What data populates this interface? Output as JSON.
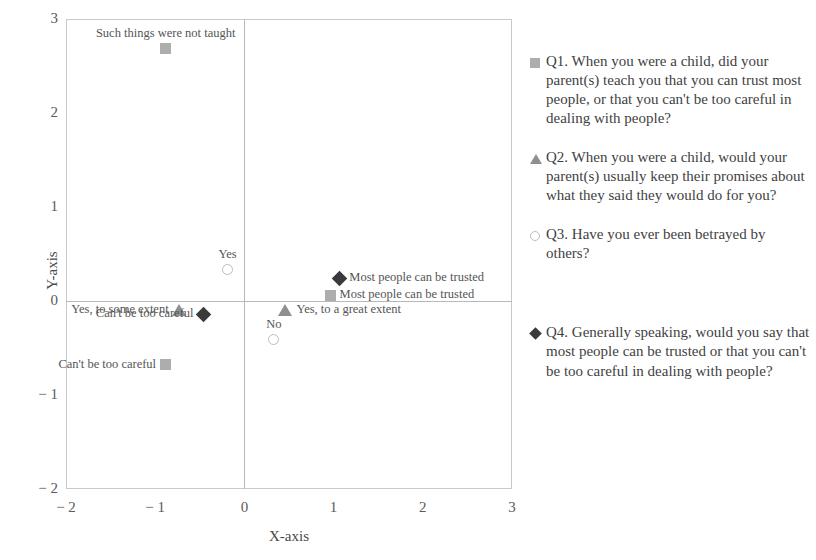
{
  "chart_data": {
    "type": "scatter",
    "title": "",
    "xlabel": "X-axis",
    "ylabel": "Y-axis",
    "xlim": [
      -2,
      3
    ],
    "ylim": [
      -2,
      3
    ],
    "xticks": [
      "− 2",
      "− 1",
      "0",
      "1",
      "2",
      "3"
    ],
    "xtick_values": [
      -2,
      -1,
      0,
      1,
      2,
      3
    ],
    "yticks": [
      "3",
      "2",
      "1",
      "0",
      "− 1",
      "− 2"
    ],
    "ytick_values": [
      3,
      2,
      1,
      0,
      -1,
      -2
    ],
    "grid": false,
    "origin_axes": true,
    "legend_position": "right",
    "series": [
      {
        "name": "Q1",
        "marker": "square",
        "color": "#adadad",
        "points": [
          {
            "label": "Such things were not taught",
            "x": -0.88,
            "y": 2.69,
            "label_pos": "above"
          },
          {
            "label": "Most people can be trusted",
            "x": 0.96,
            "y": 0.06,
            "label_pos": "right"
          },
          {
            "label": "Can't be too careful",
            "x": -0.88,
            "y": -0.68,
            "label_pos": "left"
          }
        ]
      },
      {
        "name": "Q2",
        "marker": "triangle",
        "color": "#8f8f8f",
        "points": [
          {
            "label": "Yes, to some extent",
            "x": -0.73,
            "y": -0.1,
            "label_pos": "left"
          },
          {
            "label": "Yes, to a great extent",
            "x": 0.46,
            "y": -0.1,
            "label_pos": "right"
          }
        ]
      },
      {
        "name": "Q3",
        "marker": "circle",
        "color": "#bdbdbd",
        "points": [
          {
            "label": "Yes",
            "x": -0.19,
            "y": 0.33,
            "label_pos": "above"
          },
          {
            "label": "No",
            "x": 0.33,
            "y": -0.41,
            "label_pos": "above"
          }
        ]
      },
      {
        "name": "Q4",
        "marker": "diamond",
        "color": "#3a3a3a",
        "points": [
          {
            "label": "Can't be too careful",
            "x": -0.46,
            "y": -0.14,
            "label_pos": "left"
          },
          {
            "label": "Most people can be trusted",
            "x": 1.07,
            "y": 0.24,
            "label_pos": "right"
          }
        ]
      }
    ]
  },
  "legend": {
    "items": [
      {
        "key": "Q1",
        "marker": "square",
        "icon_name": "legend-square-icon",
        "text": "Q1. When you were a child, did your parent(s) teach you that you can trust most people, or that you can't be too careful in dealing with people?"
      },
      {
        "key": "Q2",
        "marker": "triangle",
        "icon_name": "legend-triangle-icon",
        "text": "Q2. When you were a child, would your parent(s) usually keep their promises about what they said they would do for you?"
      },
      {
        "key": "Q3",
        "marker": "circle",
        "icon_name": "legend-circle-icon",
        "text": "Q3. Have you ever been betrayed by others?"
      },
      {
        "key": "Q4",
        "marker": "diamond",
        "icon_name": "legend-diamond-icon",
        "text": "Q4. Generally speaking, would you say that most people can be trusted or that you can't be too careful in dealing with people?"
      }
    ]
  }
}
